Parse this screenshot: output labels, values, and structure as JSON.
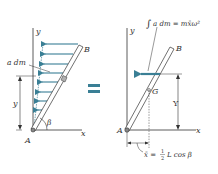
{
  "colors": {
    "arrow": "#3a7f95",
    "line": "#333333",
    "rod_fill": "#ffffff",
    "element_fill": "#b8b8b8",
    "equals": "#3a7f95"
  },
  "left_diagram": {
    "axis_labels": {
      "y": "y",
      "x": "x"
    },
    "point_labels": {
      "A": "A",
      "B": "B"
    },
    "element_label": "a dm",
    "dimension_label": "y",
    "angle_label": "β",
    "arrow_count": 8
  },
  "equals_sign": "=",
  "right_diagram": {
    "axis_labels": {
      "y": "y",
      "x": "x"
    },
    "point_labels": {
      "A": "A",
      "B": "B",
      "G": "G"
    },
    "resultant_label_integral": "∫",
    "resultant_label": "a dm = mx̄ω²",
    "dimension_label": "Y",
    "xbar_label_lhs": "x̄ =",
    "xbar_fraction_num": "1",
    "xbar_fraction_den": "2",
    "xbar_label_rhs": "L cos β"
  }
}
